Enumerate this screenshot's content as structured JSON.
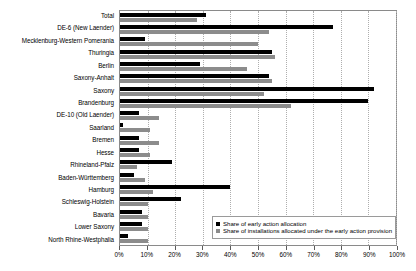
{
  "chart_data": {
    "type": "bar",
    "orientation": "horizontal",
    "title": "",
    "xlabel": "",
    "ylabel": "",
    "xlim": [
      0,
      100
    ],
    "xticks": [
      "0%",
      "10%",
      "20%",
      "30%",
      "40%",
      "50%",
      "60%",
      "70%",
      "80%",
      "90%",
      "100%"
    ],
    "xtick_values": [
      0,
      10,
      20,
      30,
      40,
      50,
      60,
      70,
      80,
      90,
      100
    ],
    "grid": true,
    "legend_position": "bottom-right",
    "categories": [
      "Total",
      "DE-6 (New Laender)",
      "Mecklenburg-Western Pomerania",
      "Thuringia",
      "Berlin",
      "Saxony-Anhalt",
      "Saxony",
      "Brandenburg",
      "DE-10 (Old Laender)",
      "Saarland",
      "Bremen",
      "Hesse",
      "Rhineland-Pfalz",
      "Baden-Württemberg",
      "Hamburg",
      "Schleswig-Holstein",
      "Bavaria",
      "Lower Saxony",
      "North Rhine-Westphalia"
    ],
    "series": [
      {
        "name": "Share of early action allocation",
        "color": "#000000",
        "values": [
          31,
          77,
          9,
          55,
          29,
          54,
          92,
          90,
          7,
          1,
          7,
          7,
          19,
          5,
          40,
          22,
          8,
          8,
          3
        ]
      },
      {
        "name": "Share of installations allocated under the early action provision",
        "color": "#8c8c8c",
        "values": [
          28,
          54,
          50,
          56,
          46,
          55,
          52,
          62,
          14,
          11,
          14,
          11,
          6,
          9,
          12,
          10,
          10,
          10,
          10
        ]
      }
    ]
  },
  "legend": {
    "items": [
      {
        "label": "Share of early action allocation",
        "swatch": "black"
      },
      {
        "label": "Share of installations allocated under the early action provision",
        "swatch": "gray"
      }
    ]
  }
}
